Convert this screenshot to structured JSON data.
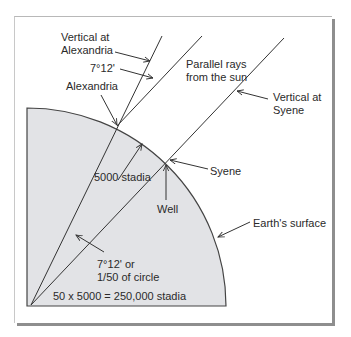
{
  "diagram": {
    "type": "eratosthenes-earth-circumference",
    "colors": {
      "earth_fill": "#e2e3e6",
      "line": "#333333",
      "frame_shadow": "#8e8e8e"
    },
    "labels": {
      "vertical_alexandria_1": "Vertical at",
      "vertical_alexandria_2": "Alexandria",
      "angle_top": "7°12'",
      "alexandria": "Alexandria",
      "parallel_rays_1": "Parallel rays",
      "parallel_rays_2": "from the sun",
      "vertical_syene_1": "Vertical at",
      "vertical_syene_2": "Syene",
      "syene": "Syene",
      "distance": "5000 stadia",
      "well": "Well",
      "earth_surface": "Earth's surface",
      "angle_center_1": "7°12' or",
      "angle_center_2": "1/50 of circle",
      "circumference": "50 x 5000 = 250,000 stadia"
    }
  }
}
